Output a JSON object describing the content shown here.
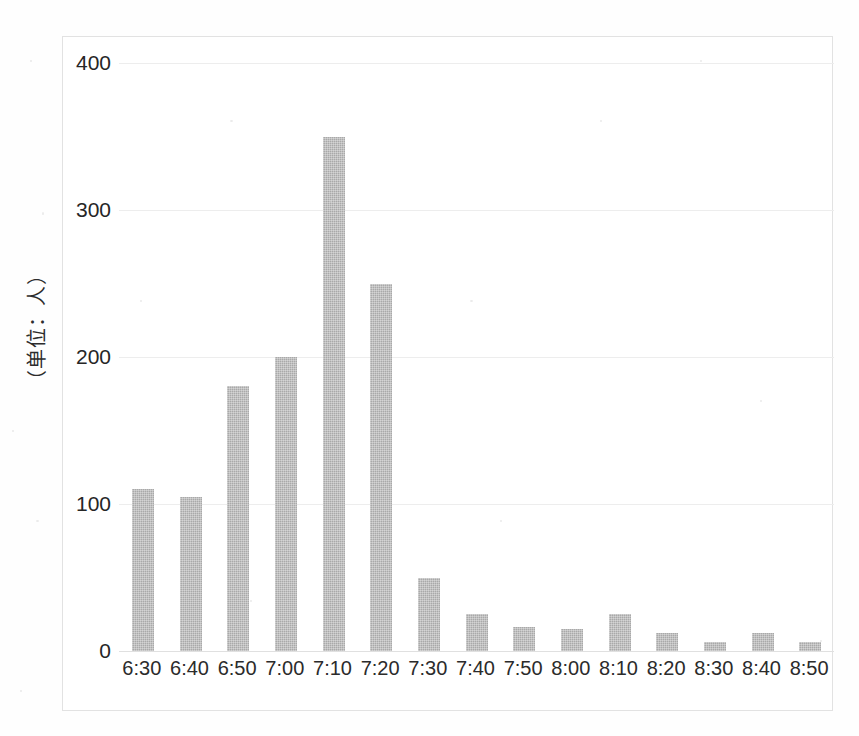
{
  "chart_data": {
    "type": "bar",
    "title": "",
    "subtitle": "",
    "xlabel": "",
    "ylabel": "（单位：人）",
    "ylim": [
      0,
      400
    ],
    "yticks": [
      0,
      100,
      200,
      300,
      400
    ],
    "ytick_labels": [
      "0",
      "100",
      "200",
      "300",
      "400"
    ],
    "grid": "horizontal",
    "legend": "none",
    "categories": [
      "6:30",
      "6:40",
      "6:50",
      "7:00",
      "7:10",
      "7:20",
      "7:30",
      "7:40",
      "7:50",
      "8:00",
      "8:10",
      "8:20",
      "8:30",
      "8:40",
      "8:50"
    ],
    "values": [
      110,
      105,
      180,
      200,
      350,
      250,
      50,
      25,
      16,
      15,
      25,
      12,
      6,
      12,
      6
    ],
    "bar_color": "#a9a9a9",
    "gridline_color": "#ededed",
    "frame_color": "#e2e2e2",
    "text_color": "#262626",
    "background_color": "#ffffff"
  }
}
